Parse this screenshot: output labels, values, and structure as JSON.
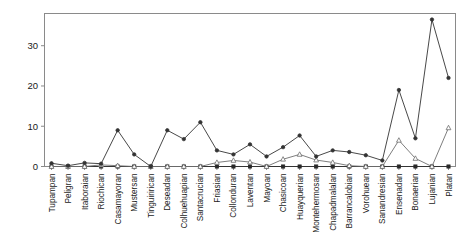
{
  "chart_data": {
    "type": "line",
    "title": "",
    "xlabel": "",
    "ylabel": "",
    "ylim": [
      0,
      38
    ],
    "yticks": [
      0,
      10,
      20,
      30
    ],
    "ytick_labels": [
      "0",
      "10",
      "20",
      "30"
    ],
    "grid": false,
    "legend_position": "none",
    "categories": [
      "Tupampan",
      "Peligran",
      "Itaboraian",
      "Riochican",
      "Casamayoran",
      "Mustersan",
      "Tinguirirican",
      "Deseadan",
      "Colhuehuapian",
      "Santacrucian",
      "Friasian",
      "Collonduran",
      "Laventan",
      "Mayoan",
      "Chasicoan",
      "Huayquerian",
      "Montehermosan",
      "Chapadmalalan",
      "Barrancalobian",
      "Vorohuean",
      "Sanandresian",
      "Ensenadan",
      "Bonaerian",
      "Lujanian",
      "Platan"
    ],
    "series": [
      {
        "name": "series-1",
        "marker": "filled-circle",
        "color": "#333333",
        "values": [
          0.8,
          0.2,
          0.9,
          0.7,
          9.0,
          3.0,
          0.0,
          9.0,
          6.8,
          11.0,
          4.0,
          3.0,
          5.5,
          2.5,
          4.8,
          7.7,
          2.5,
          4.0,
          3.6,
          2.8,
          1.5,
          19.0,
          7.0,
          36.5,
          22.0
        ]
      },
      {
        "name": "series-2",
        "marker": "open-triangle",
        "color": "#6f6f6f",
        "values": [
          0.0,
          0.0,
          0.0,
          0.4,
          0.2,
          0.0,
          0.0,
          0.0,
          0.0,
          0.0,
          1.0,
          1.5,
          1.1,
          0.0,
          1.8,
          3.0,
          1.6,
          1.0,
          0.2,
          0.0,
          0.0,
          6.5,
          2.0,
          0.0,
          9.6
        ]
      },
      {
        "name": "series-3",
        "marker": "filled-square",
        "color": "#2a2a2a",
        "values": [
          0.0,
          0.0,
          0.0,
          0.0,
          0.0,
          0.0,
          0.0,
          0.0,
          0.0,
          0.0,
          0.0,
          0.0,
          0.0,
          0.0,
          0.0,
          0.0,
          0.0,
          0.0,
          0.0,
          0.0,
          0.0,
          0.0,
          0.0,
          0.0,
          0.0
        ]
      }
    ]
  }
}
